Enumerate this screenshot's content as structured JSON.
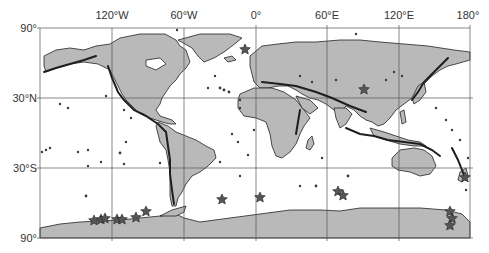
{
  "map": {
    "projection": "equirectangular",
    "frame": {
      "left": 40,
      "right": 470,
      "top": 28,
      "bottom": 238
    },
    "colors": {
      "land": "#b9b9b9",
      "coast": "#222222",
      "grid": "#555555",
      "marker": "#3a3a3a"
    },
    "lon_labels": [
      {
        "text": "120°W",
        "lon": -120
      },
      {
        "text": "60°W",
        "lon": -60
      },
      {
        "text": "0°",
        "lon": 0
      },
      {
        "text": "60°E",
        "lon": 60
      },
      {
        "text": "120°E",
        "lon": 120
      },
      {
        "text": "180°",
        "lon": 180
      }
    ],
    "lat_labels": [
      {
        "text": "90°",
        "lat": 90
      },
      {
        "text": "30°N",
        "lat": 30
      },
      {
        "text": "30°S",
        "lat": -30
      },
      {
        "text": "90°",
        "lat": -90
      }
    ],
    "star_markers": [
      {
        "lon": -22,
        "lat": 66
      },
      {
        "lon": 93,
        "lat": 36
      },
      {
        "lon": -130,
        "lat": -72
      },
      {
        "lon": -125,
        "lat": -71
      },
      {
        "lon": -122,
        "lat": -72
      },
      {
        "lon": -113,
        "lat": -72
      },
      {
        "lon": -108,
        "lat": -72
      },
      {
        "lon": -100,
        "lat": -71
      },
      {
        "lon": -92,
        "lat": -68
      },
      {
        "lon": -28,
        "lat": -55
      },
      {
        "lon": 5,
        "lat": -58
      },
      {
        "lon": 69,
        "lat": -50
      },
      {
        "lon": 73,
        "lat": -53
      },
      {
        "lon": 165,
        "lat": -72
      },
      {
        "lon": 167,
        "lat": -76
      },
      {
        "lon": 166,
        "lat": -80
      },
      {
        "lon": 177,
        "lat": -38
      }
    ]
  }
}
